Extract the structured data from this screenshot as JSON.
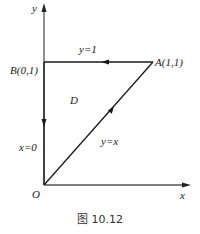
{
  "diagram": {
    "axes": {
      "x_label": "x",
      "y_label": "y",
      "origin_label": "O"
    },
    "points": [
      {
        "name": "A",
        "label": "A(1,1)",
        "x": 1,
        "y": 1
      },
      {
        "name": "B",
        "label": "B(0,1)",
        "x": 0,
        "y": 1
      },
      {
        "name": "O",
        "label": "O",
        "x": 0,
        "y": 0
      }
    ],
    "curves": [
      {
        "label": "y=1",
        "from": "A",
        "to": "B",
        "direction": "A→B"
      },
      {
        "label": "x=0",
        "from": "B",
        "to": "O",
        "direction": "B→O"
      },
      {
        "label": "y=x",
        "from": "O",
        "to": "A",
        "direction": "O→A"
      }
    ],
    "region_label": "D",
    "caption": "图 10.12",
    "stroke_color": "#1a1a1a"
  }
}
